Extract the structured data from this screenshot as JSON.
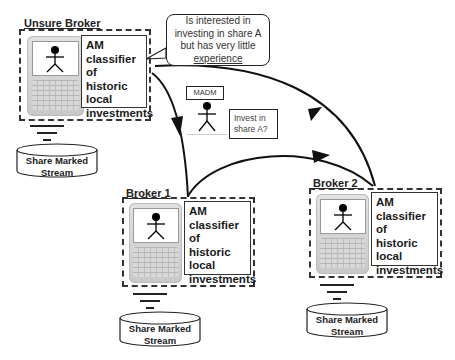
{
  "diagram": {
    "unsure_broker": {
      "title": "Unsure Broker",
      "classifier": [
        "AM",
        "classifier of",
        "historic",
        "local",
        "investments"
      ],
      "stream": [
        "Share Marked",
        "Stream"
      ],
      "thought": [
        "Is interested in",
        "investing in share A",
        "but has very little",
        "experience"
      ]
    },
    "madm": {
      "label": "MADM",
      "question": [
        "Invest in",
        "share A?"
      ]
    },
    "broker1": {
      "title": "Broker 1",
      "classifier": [
        "AM",
        "classifier of",
        "historic",
        "local",
        "investments"
      ],
      "stream": [
        "Share Marked",
        "Stream"
      ]
    },
    "broker2": {
      "title": "Broker 2",
      "classifier": [
        "AM",
        "classifier of",
        "historic",
        "local",
        "investments"
      ],
      "stream": [
        "Share Marked",
        "Stream"
      ]
    },
    "edges": [
      {
        "from": "unsure_broker",
        "to": "broker1",
        "arrow": "toward broker1"
      },
      {
        "from": "broker2",
        "to": "unsure_broker",
        "arrow": "toward unsure_broker"
      },
      {
        "from": "broker1",
        "to": "broker2",
        "arrow": "toward broker2"
      }
    ]
  }
}
